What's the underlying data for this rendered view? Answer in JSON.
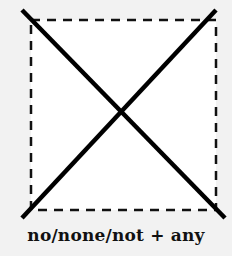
{
  "diagram": {
    "shape": "dashed-square-with-cross",
    "square": {
      "x": 31,
      "y": 20,
      "width": 185,
      "height": 190,
      "fill": "#ffffff",
      "stroke": "#111111",
      "dash": "9 7"
    },
    "cross_lines": [
      {
        "x1": 22,
        "y1": 10,
        "x2": 225,
        "y2": 218
      },
      {
        "x1": 216,
        "y1": 10,
        "x2": 22,
        "y2": 218
      }
    ],
    "line_color": "#000000",
    "background": "#f2f2f2"
  },
  "caption": "no/none/not + any"
}
